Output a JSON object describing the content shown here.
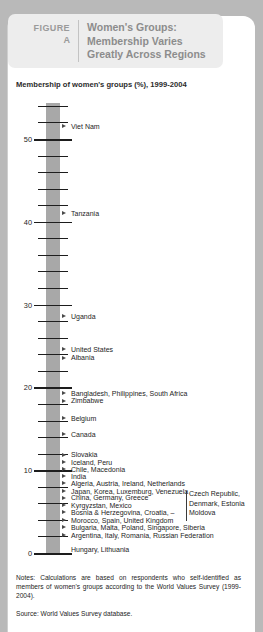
{
  "header": {
    "figure_word": "FIGURE",
    "figure_letter": "A",
    "title": "Women's Groups: Membership Varies Greatly Across Regions"
  },
  "subtitle": "Membership of women's groups (%), 1999-2004",
  "notes": "Notes: Calculations are based on respondents who self-identified as members of women's groups according to the World Values Survey (1999-2004).",
  "source": "Source: World Values Survey database.",
  "colors": {
    "page_background": "#b9b9b9",
    "card_background": "#ffffff",
    "header_panel": "#ededed",
    "header_text": "#8c8c8c",
    "axis_band": "#a8a8a8",
    "tick": "#1d1d1d",
    "marker": "#4a4a4a",
    "text": "#1d1d1d"
  },
  "chart_data": {
    "type": "bar",
    "orientation": "vertical-axis-dotplot",
    "title": "Women's Groups: Membership Varies Greatly Across Regions",
    "subtitle": "Membership of women's groups (%), 1999-2004",
    "xlabel": "",
    "ylabel": "Membership of women's groups (%)",
    "ylim": [
      0,
      55
    ],
    "ytick_labels": [
      "50",
      "40",
      "30",
      "20",
      "10",
      "0"
    ],
    "ytick_values": [
      50,
      40,
      30,
      20,
      10,
      0
    ],
    "minor_tick_interval": 2,
    "grid": false,
    "legend": null,
    "categories": [
      "Viet Nam",
      "Tanzania",
      "Uganda",
      "United States",
      "Albania",
      "Bangladesh, Philippines, South Africa",
      "Zimbabwe",
      "Belgium",
      "Canada",
      "Slovakia",
      "Iceland, Peru",
      "Chile, Macedonia",
      "India",
      "Algeria, Austria, Ireland, Netherlands",
      "Japan, Korea, Luxemburg, Venezuela",
      "China, Germany, Greece",
      "Kyrgyzstan, Mexico",
      "Bosnia & Herzegovina, Croatia, –",
      "Morocco, Spain, United Kingdom",
      "Bulgaria, Malta, Poland, Singapore, Siberia",
      "Argentina, Italy, Romania, Russian Federation",
      "Hungary, Lithuania"
    ],
    "values": [
      51.5,
      41.0,
      28.5,
      24.5,
      23.5,
      19.2,
      18.3,
      16.2,
      14.3,
      11.8,
      10.9,
      10.0,
      9.2,
      8.3,
      7.4,
      6.6,
      5.7,
      4.8,
      3.9,
      3.0,
      2.1,
      0.4
    ],
    "continuation_column": {
      "attached_to": "Bosnia & Herzegovina, Croatia, –",
      "divider": true,
      "lines": [
        "Czech Republic,",
        "Denmark, Estonia",
        "Moldova"
      ]
    }
  }
}
